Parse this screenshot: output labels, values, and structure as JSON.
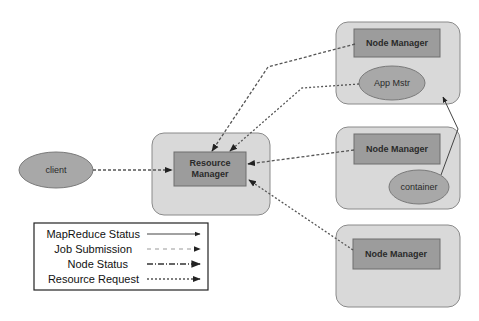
{
  "diagram": {
    "client": {
      "label": "client"
    },
    "resource_manager": {
      "label_line1": "Resource",
      "label_line2": "Manager"
    },
    "node_managers": [
      {
        "label": "Node Manager",
        "child": {
          "type": "ellipse",
          "label": "App Mstr"
        }
      },
      {
        "label": "Node Manager",
        "child": {
          "type": "ellipse",
          "label": "container"
        }
      },
      {
        "label": "Node Manager",
        "child": null
      }
    ],
    "edges": [
      {
        "from": "client",
        "to": "Resource Manager",
        "style": "Job Submission"
      },
      {
        "from": "Node Manager 1",
        "to": "Resource Manager",
        "style": "Node Status"
      },
      {
        "from": "App Mstr",
        "to": "Resource Manager",
        "style": "Resource Request"
      },
      {
        "from": "Node Manager 2",
        "to": "Resource Manager",
        "style": "Node Status"
      },
      {
        "from": "Node Manager 3",
        "to": "Resource Manager",
        "style": "Node Status"
      },
      {
        "from": "container",
        "to": "App Mstr",
        "style": "MapReduce Status"
      }
    ]
  },
  "legend": {
    "items": [
      {
        "label": "MapReduce Status",
        "style": "solid"
      },
      {
        "label": "Job Submission",
        "style": "dashed"
      },
      {
        "label": "Node Status",
        "style": "dash-dot"
      },
      {
        "label": "Resource Request",
        "style": "dotted"
      }
    ]
  },
  "colors": {
    "outer_box": "#d9d9d9",
    "inner_box": "#9c9c9c",
    "ellipse": "#a8a8a8",
    "line": "#555555"
  }
}
